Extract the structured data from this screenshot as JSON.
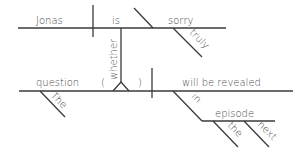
{
  "diagram": {
    "type": "sentence-diagram (Reed-Kellogg)",
    "sentence": "Jonas is truly sorry whether the question will be revealed in the next episode",
    "colors": {
      "line": "#3a3a3a",
      "text": "#4a4a4a",
      "background": "#ffffff"
    },
    "main_clause": {
      "subject": "Jonas",
      "verb": "is",
      "predicate_adjective": "sorry",
      "modifiers": {
        "sorry": "truly"
      }
    },
    "connector": {
      "word": "whether",
      "placeholder_open": "(",
      "placeholder_close": ")"
    },
    "subordinate_clause": {
      "subject": "question",
      "verb": "will be revealed",
      "modifiers": {
        "question": "The",
        "preposition": "in",
        "object": "episode",
        "object_modifiers": [
          "the",
          "next"
        ]
      }
    }
  }
}
